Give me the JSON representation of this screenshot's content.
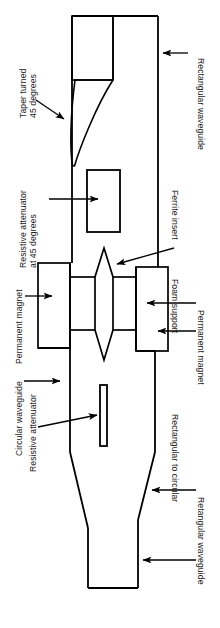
{
  "figure": {
    "orientation": "rotated-90",
    "stroke_color": "#000000",
    "fill_color": "#ffffff",
    "background": "#ffffff"
  },
  "labels": {
    "taper_turned": {
      "line1": "Taper turned",
      "line2": "45 degrees"
    },
    "resistive_attenuator_45": {
      "line1": "Resistive attenuator",
      "line2": "at 45 degrees"
    },
    "permanent_magnet_left": {
      "text": "Permanent magnet"
    },
    "circular_waveguide": {
      "text": "Circular waveguide"
    },
    "resistive_attenuator": {
      "text": "Resistive attenuator"
    },
    "rectangular_waveguide_top": {
      "text": "Rectangular waveguide"
    },
    "ferrite_insert": {
      "text": "Ferrite insert"
    },
    "foam_support": {
      "text": "Foam support"
    },
    "permanent_magnet_right": {
      "text": "Permanent magnet"
    },
    "rectangular_to_circular": {
      "text": "Rectangular to circular"
    },
    "retangular_waveguide_bottom": {
      "text": "Retangular waveguide"
    }
  },
  "parts": [
    {
      "name": "rectangular-waveguide-top",
      "shape": "rectangle"
    },
    {
      "name": "taper-turned-45",
      "shape": "wedge"
    },
    {
      "name": "resistive-attenuator-45-card",
      "shape": "rectangle"
    },
    {
      "name": "ferrite-insert",
      "shape": "lens"
    },
    {
      "name": "permanent-magnet-left-block",
      "shape": "rectangle"
    },
    {
      "name": "permanent-magnet-right-block",
      "shape": "rectangle"
    },
    {
      "name": "foam-support",
      "shape": "channel"
    },
    {
      "name": "circular-waveguide-body",
      "shape": "tube"
    },
    {
      "name": "resistive-attenuator-slab",
      "shape": "thin-rectangle"
    },
    {
      "name": "rectangular-to-circular-transition",
      "shape": "taper"
    },
    {
      "name": "retangular-waveguide-bottom",
      "shape": "rectangle"
    }
  ]
}
